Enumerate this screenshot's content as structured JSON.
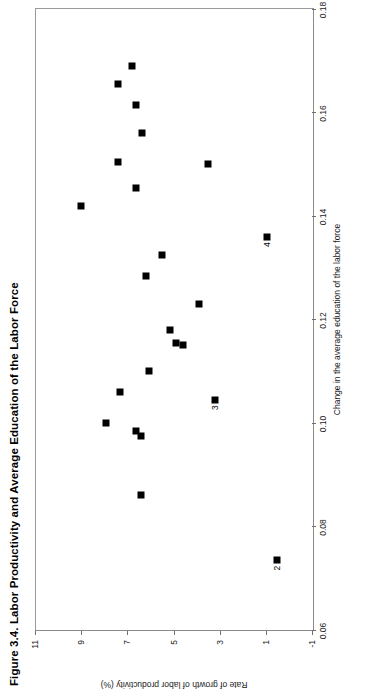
{
  "figure": {
    "title": "Figure 3.4.  Labor Productivity and Average Education of the Labor Force"
  },
  "chart_data": {
    "type": "scatter",
    "title": "Figure 3.4.  Labor Productivity and Average Education of the Labor Force",
    "xlabel": "Change in the average education of the labor force",
    "ylabel": "Rate of growth of labor productivity (%)",
    "xlim": [
      0.06,
      0.18
    ],
    "ylim": [
      -1,
      11
    ],
    "xticks": [
      0.06,
      0.08,
      0.1,
      0.12,
      0.14,
      0.16,
      0.18
    ],
    "xtick_labels": [
      "0.06",
      "0.08",
      "0.10",
      "0.12",
      "0.14",
      "0.16",
      "0.18"
    ],
    "yticks": [
      -1,
      1,
      3,
      5,
      7,
      9,
      11
    ],
    "ytick_labels": [
      "-1",
      "1",
      "3",
      "5",
      "7",
      "9",
      "11"
    ],
    "grid": false,
    "legend": null,
    "marker": "square",
    "marker_color": "#000000",
    "points": [
      {
        "x": 0.1655,
        "y": 7.45,
        "label": ""
      },
      {
        "x": 0.169,
        "y": 6.85,
        "label": ""
      },
      {
        "x": 0.1615,
        "y": 6.65,
        "label": ""
      },
      {
        "x": 0.156,
        "y": 6.4,
        "label": ""
      },
      {
        "x": 0.1505,
        "y": 7.45,
        "label": ""
      },
      {
        "x": 0.15,
        "y": 3.55,
        "label": ""
      },
      {
        "x": 0.1455,
        "y": 6.65,
        "label": ""
      },
      {
        "x": 0.142,
        "y": 9.05,
        "label": ""
      },
      {
        "x": 0.136,
        "y": 1.0,
        "label": "4"
      },
      {
        "x": 0.1325,
        "y": 5.55,
        "label": ""
      },
      {
        "x": 0.1285,
        "y": 6.25,
        "label": ""
      },
      {
        "x": 0.123,
        "y": 3.95,
        "label": ""
      },
      {
        "x": 0.118,
        "y": 5.2,
        "label": ""
      },
      {
        "x": 0.1155,
        "y": 4.95,
        "label": ""
      },
      {
        "x": 0.115,
        "y": 4.65,
        "label": ""
      },
      {
        "x": 0.11,
        "y": 6.1,
        "label": ""
      },
      {
        "x": 0.106,
        "y": 7.35,
        "label": ""
      },
      {
        "x": 0.1045,
        "y": 3.25,
        "label": "3"
      },
      {
        "x": 0.1,
        "y": 7.95,
        "label": ""
      },
      {
        "x": 0.0985,
        "y": 6.65,
        "label": ""
      },
      {
        "x": 0.0975,
        "y": 6.45,
        "label": ""
      },
      {
        "x": 0.086,
        "y": 6.45,
        "label": ""
      },
      {
        "x": 0.0735,
        "y": 0.55,
        "label": "2"
      }
    ]
  }
}
